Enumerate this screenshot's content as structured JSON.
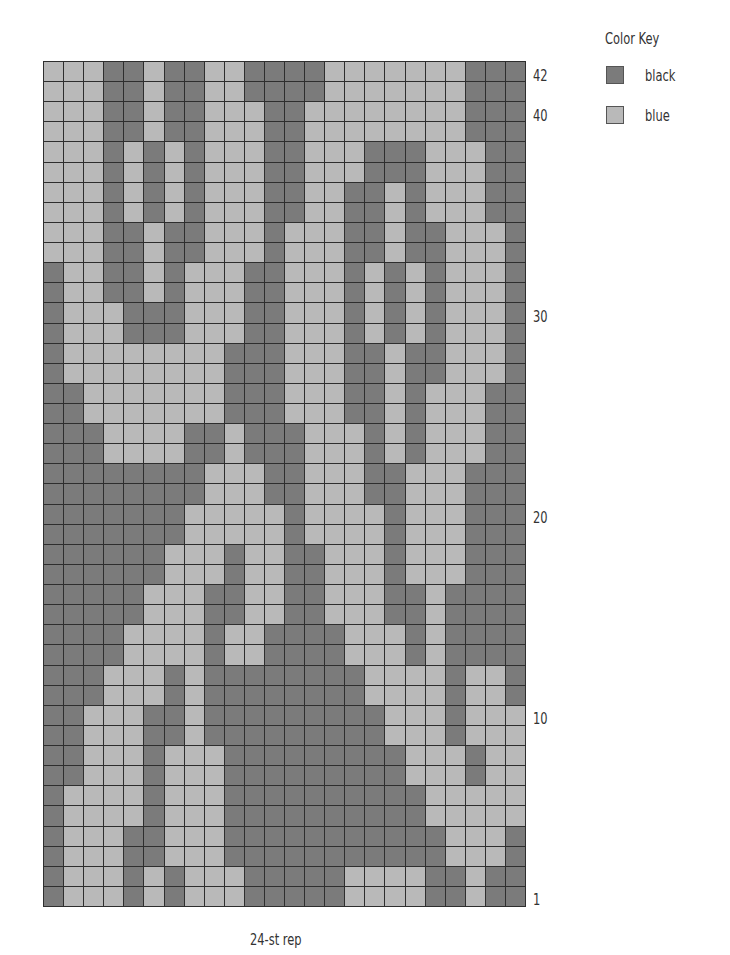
{
  "colors": {
    "black": "#7b7b7b",
    "blue": "#b9b9b9",
    "gridline": "#2e2e2e"
  },
  "legend": {
    "title": "Color Key",
    "items": [
      {
        "label": "black",
        "color": "#7b7b7b"
      },
      {
        "label": "blue",
        "color": "#b9b9b9"
      }
    ]
  },
  "row_labels": [
    {
      "text": "42",
      "row": 42
    },
    {
      "text": "40",
      "row": 40
    },
    {
      "text": "30",
      "row": 30
    },
    {
      "text": "20",
      "row": 20
    },
    {
      "text": "10",
      "row": 10
    },
    {
      "text": "1",
      "row": 1
    }
  ],
  "footer": {
    "repeat_label": "24-st rep"
  },
  "chart_data": {
    "type": "heatmap",
    "title": "Color Key",
    "columns": 24,
    "rows": 42,
    "legend": [
      "black",
      "blue"
    ],
    "encoding": "B = black, L = blue; rows listed top (row 42) to bottom (row 1), columns left to right",
    "grid": [
      "LLLBBLBBLLBBBBLLLLLLLBBB",
      "LLLBBLBBLLBBBBLLLLLLLBBB",
      "LLLBBLBBLLLBBLLLLLLLLBBB",
      "LLLBBLBBLLLBBLLLLLLLLBBB",
      "LLLBLBLBLLLBBLLLBBBLLLBB",
      "LLLBLBLBLLLBBLLLBBBLLLBB",
      "LLLBLBLBLLLBBLLBBLBLLLBB",
      "LLLBLBLBLLLBBLLBBLBLLLBB",
      "LLLBBLBBLLLBLLLBBLBBLLLB",
      "LLLBBLBBLLLBLLLBBLBBLLLB",
      "BLLBBLBLLLBBLLLBLBLBLLLB",
      "BLLBBLBLLLBBLLLBLBLBLLLB",
      "BLLLBBBLLLBBLLLBLBLBLLLB",
      "BLLLBBBLLLBBLLLBLBLBLLLB",
      "BLLLLLLLLBBBLLLBBLBBLLLB",
      "BLLLLLLLLBBBLLLBBLBBLLLB",
      "BBLLLLLLLBBBLLLBBLBLLLBB",
      "BBLLLLLLLBBBLLLBBLBLLLBB",
      "BBBLLLLBBLBBBLLLBLBLLLBB",
      "BBBLLLLBBLBBBLLLBLBLLLBB",
      "BBBBBBBBLLLBBLLLBBLLLBBB",
      "BBBBBBBBLLLBBLLLBBLLLBBB",
      "BBBBBBBLLLLLBLLLLBLLLBBB",
      "BBBBBBBLLLLLBLLLLBLLLBBB",
      "BBBBBBLLLBLLBBLLLBLLLBBB",
      "BBBBBBLLLBLLBBLLLBLLLBBB",
      "BBBBBLLLBBLLBBLLLBBLBBBB",
      "BBBBBLLLBBLLBBLLLBBLBBBB",
      "BBBBLLLLBLLBBBBLLLBLBBBB",
      "BBBBLLLLBLLBBBBLLLBLBBBB",
      "BBBLLLBLBBBBBBBBLLLLBLLB",
      "BBBLLLBLBBBBBBBBLLLLBLLB",
      "BBLLLBBLBBBBBBBBBLLLBLLL",
      "BBLLLBBLBBBBBBBBBLLLBLLL",
      "BBLLLBLLLBBBBBBBBBLLLBLL",
      "BBLLLBLLLBBBBBBBBBLLLBLL",
      "BLLLLBLLLBBBBBBBBBBLLLLL",
      "BLLLLBLLLBBBBBBBBBBLLLLL",
      "BLLLBBLLLBBBBBBBBBBBLLLB",
      "BLLLBBLLLBBBBBBBBBBBLLLB",
      "BLLLBLBLLLBBBBBLLLLBBLBB",
      "BLLLBLBLLLBBBBBLLLLBBLBB"
    ],
    "row_tick_labels": [
      "42",
      "40",
      "30",
      "20",
      "10",
      "1"
    ],
    "xlabel": "24-st rep"
  }
}
